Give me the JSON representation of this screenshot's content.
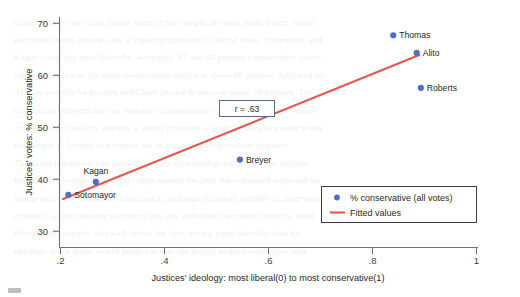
{
  "chart_data": {
    "type": "scatter",
    "title": "",
    "xlabel": "Justices' ideology: most liberal(0) to most conservative(1)",
    "ylabel": "Justices' votes: % conservative",
    "xlim": [
      0.18,
      1.02
    ],
    "ylim": [
      28.0,
      72.0
    ],
    "xticks": [
      0.2,
      0.4,
      0.6,
      0.8,
      1.0
    ],
    "xtick_labels": [
      ".2",
      ".4",
      ".6",
      ".8",
      "1"
    ],
    "yticks": [
      30,
      40,
      50,
      60,
      70
    ],
    "ytick_labels": [
      "30",
      "40",
      "50",
      "60",
      "70"
    ],
    "grid": false,
    "legend_position": "lower-right",
    "annotation": "r = .63",
    "correlation": 0.63,
    "points": [
      {
        "name": "Sotomayor",
        "x": 0.215,
        "y": 37.0,
        "label_pos": "right"
      },
      {
        "name": "Kagan",
        "x": 0.268,
        "y": 39.5,
        "label_pos": "above"
      },
      {
        "name": "Breyer",
        "x": 0.545,
        "y": 43.8,
        "label_pos": "right"
      },
      {
        "name": "Thomas",
        "x": 0.84,
        "y": 67.7,
        "label_pos": "right"
      },
      {
        "name": "Alito",
        "x": 0.885,
        "y": 64.3,
        "label_pos": "right"
      },
      {
        "name": "Roberts",
        "x": 0.893,
        "y": 57.6,
        "label_pos": "right"
      }
    ],
    "series": [
      {
        "name": "% conservative (all votes)",
        "type": "scatter",
        "color": "#4f6fc0",
        "x": [
          0.215,
          0.268,
          0.545,
          0.84,
          0.885,
          0.893
        ],
        "values": [
          37.0,
          39.5,
          43.8,
          67.7,
          64.3,
          57.6
        ]
      },
      {
        "name": "Fitted values",
        "type": "line",
        "color": "#e4584c",
        "x": [
          0.205,
          0.89
        ],
        "values": [
          36.2,
          63.9
        ]
      }
    ]
  },
  "legend": {
    "items": [
      {
        "label": "% conservative (all votes)",
        "marker": "dot",
        "color": "#4f6fc0"
      },
      {
        "label": "Fitted values",
        "marker": "line",
        "color": "#e4584c"
      }
    ]
  },
  "colors": {
    "marker": "#4f6fc0",
    "fit_line": "#e4584c",
    "axis": "#6f6f77",
    "text": "#1f1f25",
    "background": "#ffffff"
  },
  "background_text": {
    "lines": [
      "conservative votes than liberal votes in the sample of cases studied here, while",
      "the more liberal justices cast a higher proportion of liberal votes. Sotomayor and",
      "Kagan voted the most liberally, at roughly 37 and 40 percent conservative votes,",
      "while Thomas was the most conservative justice at about 68 percent, followed by",
      "Alito at roughly 64 percent and Chief Justice Roberts at about 58 percent. The",
      "correlation between the two measures is moderately strong and positive, which",
      "suggests that ideology remains a useful predictor of judicial behavior even when",
      "the sample is limited to a narrow set of statutory interpretation disputes.",
      "",
      "The fitted regression line summarizes the relationship across all nine justices.",
      "Because the scatter is relatively tight around the line, the estimated slope can be",
      "interpreted with reasonable confidence, although the small number of observations",
      "counsels against reading too much into any individual deviation from the trend.",
      "Breyer, for example, sits well below the line, voting more liberally than his",
      "ideology score alone would predict across the period under examination here."
    ]
  }
}
